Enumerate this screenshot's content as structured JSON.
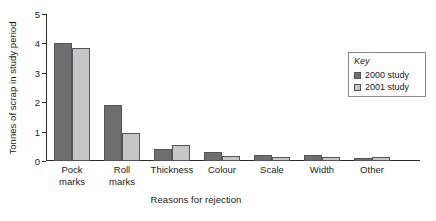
{
  "chart_data": {
    "type": "bar",
    "title": "",
    "xlabel": "Reasons for rejection",
    "ylabel": "Tonnes of scrap in study period",
    "ylim": [
      0,
      5
    ],
    "yticks": [
      "0",
      "1",
      "2",
      "3",
      "4",
      "5"
    ],
    "grid": false,
    "legend_position": "top-right",
    "legend_title": "Key",
    "categories": [
      "Pock\nmarks",
      "Roll\nmarks",
      "Thickness",
      "Colour",
      "Scale",
      "Width",
      "Other"
    ],
    "series": [
      {
        "name": "2000 study",
        "color": "#6e6e6e",
        "values": [
          4.0,
          1.9,
          0.4,
          0.3,
          0.2,
          0.2,
          0.1
        ]
      },
      {
        "name": "2001 study",
        "color": "#c6c6c6",
        "values": [
          3.85,
          0.95,
          0.55,
          0.18,
          0.15,
          0.15,
          0.15
        ]
      }
    ]
  },
  "axes": {
    "y_title": "Tonnes of scrap in study period",
    "x_title": "Reasons for rejection"
  },
  "legend": {
    "title": "Key",
    "entries": [
      {
        "label": "2000 study",
        "color": "#6e6e6e"
      },
      {
        "label": "2001 study",
        "color": "#c6c6c6"
      }
    ]
  }
}
